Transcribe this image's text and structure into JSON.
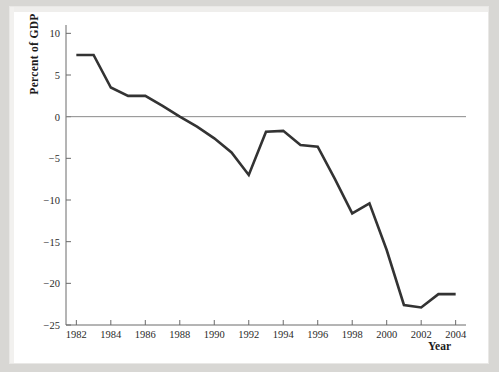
{
  "figure": {
    "background_color": "#ffffff",
    "page_color": "#d8d7d4",
    "line_color": "#333333",
    "axis_color": "#6a6a6a"
  },
  "chart_data": {
    "type": "line",
    "title": "",
    "xlabel": "Year",
    "ylabel": "Percent of GDP",
    "xlim": [
      1981.4,
      2004.6
    ],
    "ylim": [
      -25,
      11
    ],
    "grid": false,
    "legend": null,
    "zero_line": 0,
    "y_ticks": [
      10,
      5,
      0,
      -5,
      -10,
      -15,
      -20,
      -25
    ],
    "y_tick_labels": [
      "10",
      "5",
      "0",
      "-5",
      "-10",
      "-15",
      "-20",
      "-25"
    ],
    "x_ticks": [
      1982,
      1984,
      1986,
      1988,
      1990,
      1992,
      1994,
      1996,
      1998,
      2000,
      2002,
      2004
    ],
    "x_tick_labels": [
      "1982",
      "1984",
      "1986",
      "1988",
      "1990",
      "1992",
      "1994",
      "1996",
      "1998",
      "2000",
      "2002",
      "2004"
    ],
    "x": [
      1982,
      1983,
      1984,
      1985,
      1986,
      1987,
      1988,
      1989,
      1990,
      1991,
      1992,
      1993,
      1994,
      1995,
      1996,
      1997,
      1998,
      1999,
      2000,
      2001,
      2002,
      2003,
      2004
    ],
    "series": [
      {
        "name": "Percent of GDP",
        "values": [
          7.4,
          7.4,
          3.5,
          2.5,
          2.5,
          1.3,
          0.0,
          -1.2,
          -2.6,
          -4.3,
          -7.0,
          -1.8,
          -1.7,
          -3.4,
          -3.6,
          -7.5,
          -11.6,
          -10.4,
          -16.0,
          -22.6,
          -22.9,
          -21.3,
          -21.3
        ]
      }
    ]
  }
}
